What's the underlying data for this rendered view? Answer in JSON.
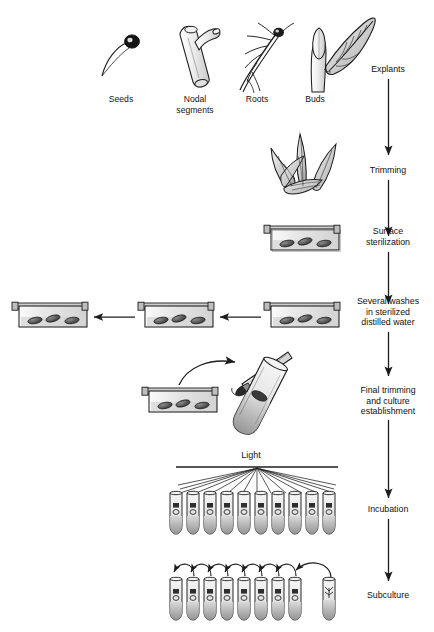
{
  "diagram": {
    "background_color": "#ffffff",
    "ink_color": "#1d1d1d"
  },
  "explant_sources": [
    {
      "label": "Seeds",
      "icon": "seed-icon"
    },
    {
      "label": "Nodal\nsegments",
      "icon": "nodal-segment-icon"
    },
    {
      "label": "Roots",
      "icon": "root-icon"
    },
    {
      "label": "Buds",
      "icon": "bud-leaf-icon"
    }
  ],
  "steps": [
    {
      "label": "Explants"
    },
    {
      "label": "Trimming"
    },
    {
      "label": "Surface\nsterilization"
    },
    {
      "label": "Several washes\nin sterilized\ndistilled water"
    },
    {
      "label": "Final trimming\nand culture\nestablishment"
    },
    {
      "label": "Incubation"
    },
    {
      "label": "Subculture"
    }
  ],
  "light": {
    "label": "Light",
    "ray_count": 11
  },
  "dishes": {
    "explants_per_dish": 3,
    "sterilization_count": 1,
    "washing_row_count": 3,
    "trimming_row_count": 1
  },
  "tubes": {
    "incubation_count": 10,
    "subculture_group_count": 8,
    "subculture_fresh_count": 1,
    "subculture_arrow_count": 7
  }
}
